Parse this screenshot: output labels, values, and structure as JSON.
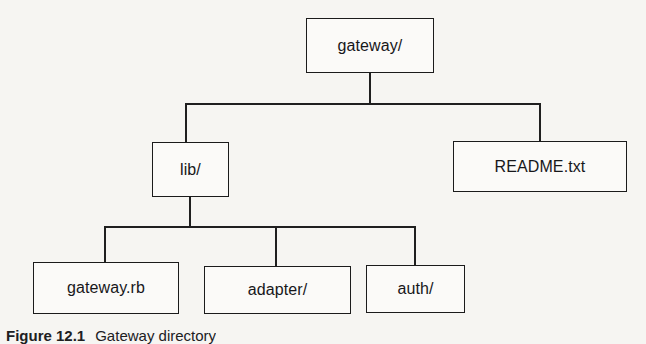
{
  "diagram": {
    "type": "directory-tree",
    "colors": {
      "background": "#f6f5f2",
      "box_fill": "#fbfaf8",
      "box_stroke": "#1b1b1b",
      "connector": "#1f1f1f",
      "text": "#17171a"
    },
    "nodes": [
      {
        "id": "gateway",
        "label": "gateway/",
        "level": 0
      },
      {
        "id": "lib",
        "label": "lib/",
        "level": 1
      },
      {
        "id": "readme",
        "label": "README.txt",
        "level": 1
      },
      {
        "id": "gateway_rb",
        "label": "gateway.rb",
        "level": 2
      },
      {
        "id": "adapter",
        "label": "adapter/",
        "level": 2
      },
      {
        "id": "auth",
        "label": "auth/",
        "level": 2
      }
    ],
    "edges": [
      {
        "from": "gateway",
        "to": "lib"
      },
      {
        "from": "gateway",
        "to": "readme"
      },
      {
        "from": "lib",
        "to": "gateway_rb"
      },
      {
        "from": "lib",
        "to": "adapter"
      },
      {
        "from": "lib",
        "to": "auth"
      }
    ]
  },
  "caption": {
    "number": "Figure 12.1",
    "text": "Gateway directory"
  }
}
